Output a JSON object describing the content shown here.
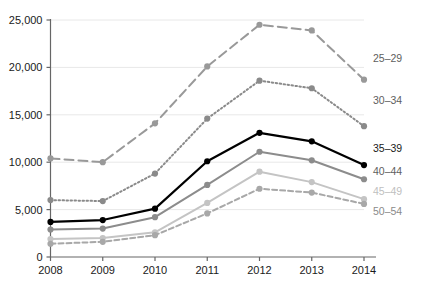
{
  "chart_data": {
    "type": "line",
    "title": "",
    "subtitle": "",
    "xlabel": "",
    "ylabel": "",
    "categories": [
      "2008",
      "2009",
      "2010",
      "2011",
      "2012",
      "2013",
      "2014"
    ],
    "x": [
      2008,
      2009,
      2010,
      2011,
      2012,
      2013,
      2014
    ],
    "xlim": [
      2008,
      2014
    ],
    "ylim": [
      0,
      25000
    ],
    "yticks": [
      0,
      5000,
      10000,
      15000,
      20000,
      25000
    ],
    "ytick_labels": [
      "0",
      "5,000",
      "10,000",
      "15,000",
      "20,000",
      "25,000"
    ],
    "grid": true,
    "grid_axis": "y",
    "legend_position": "right-inline",
    "markers": "circle",
    "series": [
      {
        "name": "25–29",
        "values": [
          10400,
          10000,
          14100,
          20100,
          24500,
          23900,
          18700
        ],
        "color": "#999999",
        "dash": "9,5",
        "width": 2.0
      },
      {
        "name": "30–34",
        "values": [
          6000,
          5900,
          8800,
          14600,
          18600,
          17800,
          13800
        ],
        "color": "#8a8a8a",
        "dash": "1.5,2.5",
        "width": 2.0
      },
      {
        "name": "35–39",
        "values": [
          3700,
          3900,
          5100,
          10100,
          13100,
          12200,
          9700
        ],
        "color": "#000000",
        "dash": "none",
        "width": 2.2
      },
      {
        "name": "40–44",
        "values": [
          2900,
          3000,
          4200,
          7600,
          11100,
          10200,
          8200
        ],
        "color": "#8c8c8c",
        "dash": "none",
        "width": 2.0
      },
      {
        "name": "45–49",
        "values": [
          1900,
          2000,
          2600,
          5700,
          9000,
          7900,
          6100
        ],
        "color": "#c4c4c4",
        "dash": "none",
        "width": 2.0
      },
      {
        "name": "50–54",
        "values": [
          1400,
          1600,
          2300,
          4600,
          7200,
          6800,
          5600
        ],
        "color": "#a8a8a8",
        "dash": "5,3",
        "width": 2.0
      }
    ]
  },
  "legend": {
    "items": [
      {
        "label": "25–29",
        "color": "#5e5e5e"
      },
      {
        "label": "30–34",
        "color": "#5e5e5e"
      },
      {
        "label": "35–39",
        "color": "#1a1a1a"
      },
      {
        "label": "40–44",
        "color": "#5e5e5e"
      },
      {
        "label": "45–49",
        "color": "#c0c0c0"
      },
      {
        "label": "50–54",
        "color": "#8a8a8a"
      }
    ]
  },
  "axes": {
    "y_tick_labels": [
      "25,000",
      "20,000",
      "15,000",
      "10,000",
      "5,000",
      "0"
    ],
    "x_tick_labels": [
      "2008",
      "2009",
      "2010",
      "2011",
      "2012",
      "2013",
      "2014"
    ]
  },
  "colors": {
    "axis": "#666666",
    "grid": "#e8e8e8",
    "text": "#1a1a1a",
    "background": "#ffffff"
  }
}
